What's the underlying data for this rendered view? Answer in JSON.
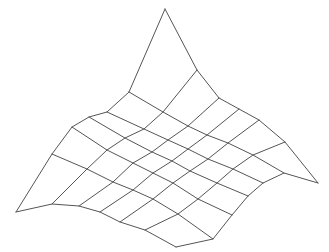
{
  "figure": {
    "title": "",
    "background": "#ffffff",
    "stroke_color": "#555555",
    "stroke_width": 1
  },
  "chart_data": {
    "type": "wireframe-surface",
    "title": "",
    "xlabel": "",
    "ylabel": "",
    "zlabel": "",
    "grid_rows": 7,
    "grid_cols": 7,
    "projected_vertices": [
      [
        [
          16,
          212
        ],
        [
          52,
          154
        ],
        [
          72,
          127
        ],
        [
          89,
          117
        ],
        [
          107,
          112
        ],
        [
          129,
          92
        ],
        [
          165,
          9
        ]
      ],
      [
        [
          52,
          204
        ],
        [
          87,
          169
        ],
        [
          107,
          150
        ],
        [
          125,
          138
        ],
        [
          144,
          129
        ],
        [
          163,
          112
        ],
        [
          197,
          70
        ]
      ],
      [
        [
          79,
          206
        ],
        [
          113,
          182
        ],
        [
          133,
          163
        ],
        [
          152,
          152
        ],
        [
          168,
          140
        ],
        [
          188,
          126
        ],
        [
          219,
          98
        ]
      ],
      [
        [
          100,
          212
        ],
        [
          133,
          190
        ],
        [
          153,
          173
        ],
        [
          172,
          161
        ],
        [
          188,
          149
        ],
        [
          207,
          135
        ],
        [
          239,
          109
        ]
      ],
      [
        [
          120,
          222
        ],
        [
          153,
          199
        ],
        [
          173,
          183
        ],
        [
          190,
          171
        ],
        [
          208,
          159
        ],
        [
          228,
          143
        ],
        [
          259,
          120
        ]
      ],
      [
        [
          145,
          230
        ],
        [
          178,
          214
        ],
        [
          198,
          199
        ],
        [
          217,
          183
        ],
        [
          233,
          169
        ],
        [
          253,
          155
        ],
        [
          285,
          142
        ]
      ],
      [
        [
          176,
          247
        ],
        [
          213,
          239
        ],
        [
          232,
          215
        ],
        [
          248,
          196
        ],
        [
          263,
          183
        ],
        [
          284,
          173
        ],
        [
          318,
          183
        ]
      ]
    ],
    "corners": {
      "left": [
        16,
        212
      ],
      "peak": [
        165,
        9
      ],
      "right": [
        318,
        183
      ],
      "bottom": [
        176,
        247
      ]
    }
  }
}
